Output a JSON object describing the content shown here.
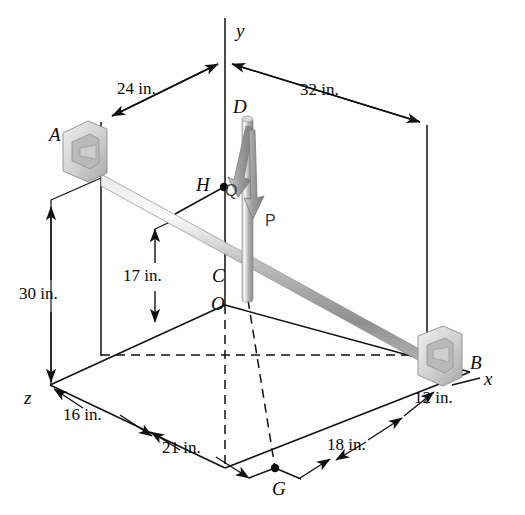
{
  "figure": {
    "background_color": "#fefefe",
    "line_color": "#111111",
    "rod_color": "#a8a8a8",
    "arrow_color": "#8d8d8d"
  },
  "axes": [
    {
      "name": "y-axis",
      "label": "y"
    },
    {
      "name": "x-axis",
      "label": "x"
    },
    {
      "name": "z-axis",
      "label": "z"
    }
  ],
  "points": [
    {
      "name": "A",
      "label": "A"
    },
    {
      "name": "B",
      "label": "B"
    },
    {
      "name": "C",
      "label": "C"
    },
    {
      "name": "D",
      "label": "D"
    },
    {
      "name": "G",
      "label": "G"
    },
    {
      "name": "H",
      "label": "H"
    },
    {
      "name": "O",
      "label": "O"
    }
  ],
  "forces": [
    {
      "name": "P",
      "label": "P"
    },
    {
      "name": "Q",
      "label": "Q"
    }
  ],
  "dimensions": [
    {
      "name": "dim-24in",
      "label": "24 in."
    },
    {
      "name": "dim-32in",
      "label": "32 in."
    },
    {
      "name": "dim-30in",
      "label": "30 in."
    },
    {
      "name": "dim-17in",
      "label": "17 in."
    },
    {
      "name": "dim-16in",
      "label": "16 in."
    },
    {
      "name": "dim-12in",
      "label": "12 in."
    },
    {
      "name": "dim-21in",
      "label": "21 in."
    },
    {
      "name": "dim-18in",
      "label": "18 in."
    }
  ]
}
